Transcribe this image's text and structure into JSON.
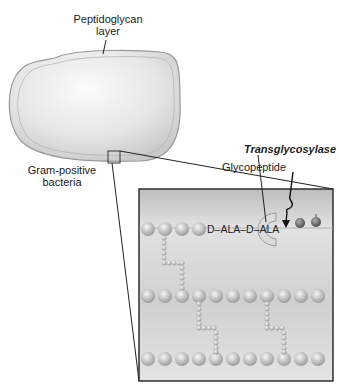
{
  "labels": {
    "peptidoglycan": "Peptidoglycan",
    "peptidoglycan_line2": "layer",
    "gram_positive": "Gram-positive",
    "gram_positive_line2": "bacteria",
    "transglycosylase": "Transglycosylase",
    "glycopeptide": "Glycopeptide",
    "dala": "D–ALA–D–ALA"
  },
  "colors": {
    "cell_fill": "#dcdcdc",
    "cell_edge": "#9a9a9a",
    "box_fill": "#d6d6d6",
    "bead": "#c8c8c8",
    "dark_bead": "#777777",
    "line": "#222222"
  }
}
